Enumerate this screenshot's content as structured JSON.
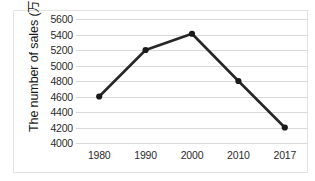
{
  "chart_data": {
    "type": "line",
    "title": "",
    "xlabel": "",
    "ylabel": "The number of sales (万部)",
    "categories": [
      "1980",
      "1990",
      "2000",
      "2010",
      "2017"
    ],
    "values": [
      4600,
      5200,
      5410,
      4800,
      4200
    ],
    "series": [
      {
        "name": "The number of sales",
        "values": [
          4600,
          5200,
          5410,
          4800,
          4200
        ]
      }
    ],
    "ylim": [
      4000,
      5600
    ],
    "ytick_labels": [
      "5600",
      "5400",
      "5200",
      "5000",
      "4800",
      "4600",
      "4400",
      "4200",
      "4000"
    ],
    "ytick_values": [
      5600,
      5400,
      5200,
      5000,
      4800,
      4600,
      4400,
      4200,
      4000
    ],
    "ystep": 200,
    "xtick_labels": [
      "1980",
      "1990",
      "2000",
      "2010",
      "2017"
    ],
    "grid": true,
    "grid_axis": "y",
    "legend": false,
    "legend_position": "none",
    "line_color": "#262626",
    "marker": "circle",
    "marker_color": "#1a1a1a",
    "gridline_color": "#d9d9d9",
    "border_color": "#e3e3e3",
    "background": "#ffffff"
  }
}
